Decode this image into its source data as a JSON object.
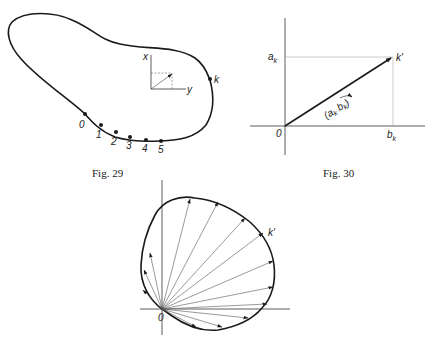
{
  "figures": [
    {
      "caption": "Fig. 29",
      "point_labels": [
        "0",
        "1",
        "2",
        "3",
        "4",
        "5",
        "k"
      ],
      "axis_labels": {
        "x": "x",
        "y": "y"
      }
    },
    {
      "caption": "Fig. 30",
      "labels": {
        "a": "a",
        "a_sub": "k",
        "b": "b",
        "b_sub": "k",
        "origin": "0",
        "point": "k'",
        "vector": "(a",
        "vector_sub1": "k",
        "vector_b": " b",
        "vector_sub2": "k",
        "vector_close": ")"
      }
    },
    {
      "caption": "",
      "labels": {
        "origin": "0",
        "point": "k'"
      }
    }
  ],
  "colors": {
    "ink": "#1a1a1a",
    "background": "#ffffff"
  }
}
